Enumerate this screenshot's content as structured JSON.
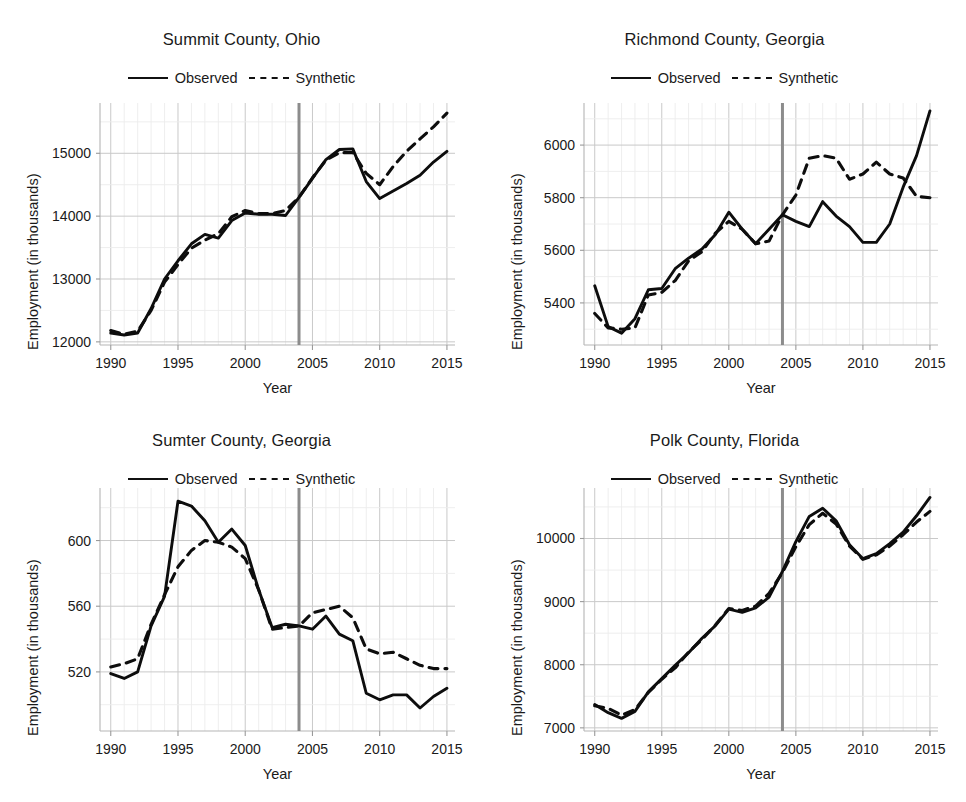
{
  "figure": {
    "panel_count": 4,
    "legend": {
      "observed_label": "Observed",
      "synthetic_label": "Synthetic"
    },
    "axis_labels": {
      "x": "Year",
      "y": "Employment (in thousands)"
    }
  },
  "chart_data": [
    {
      "type": "line",
      "title": "Summit County, Ohio",
      "xlabel": "Year",
      "ylabel": "Employment (in thousands)",
      "xlim": [
        1989.2,
        2015.6
      ],
      "ylim": [
        11950,
        15800
      ],
      "xticks": [
        1990,
        1995,
        2000,
        2005,
        2010,
        2015
      ],
      "yticks": [
        12000,
        13000,
        14000,
        15000
      ],
      "grid": true,
      "legend_position": "top-center",
      "intervention_year": 2004,
      "x": [
        1990,
        1991,
        1992,
        1993,
        1994,
        1995,
        1996,
        1997,
        1998,
        1999,
        2000,
        2001,
        2002,
        2003,
        2004,
        2005,
        2006,
        2007,
        2008,
        2009,
        2010,
        2011,
        2012,
        2013,
        2014,
        2015
      ],
      "series": [
        {
          "name": "Observed",
          "style": "solid",
          "values": [
            12140,
            12110,
            12140,
            12530,
            13000,
            13290,
            13560,
            13710,
            13650,
            13930,
            14050,
            14030,
            14030,
            14010,
            14300,
            14600,
            14900,
            15060,
            15070,
            14550,
            14280,
            14400,
            14520,
            14650,
            14860,
            15030
          ]
        },
        {
          "name": "Synthetic",
          "style": "dashed",
          "values": [
            12180,
            12120,
            12170,
            12500,
            12950,
            13230,
            13490,
            13620,
            13720,
            13990,
            14090,
            14040,
            14040,
            14090,
            14300,
            14610,
            14890,
            15010,
            15010,
            14680,
            14500,
            14790,
            15030,
            15230,
            15420,
            15640
          ]
        }
      ]
    },
    {
      "type": "line",
      "title": "Richmond County, Georgia",
      "xlabel": "Year",
      "ylabel": "Employment (in thousands)",
      "xlim": [
        1989.2,
        2015.6
      ],
      "ylim": [
        5240,
        6160
      ],
      "xticks": [
        1990,
        1995,
        2000,
        2005,
        2010,
        2015
      ],
      "yticks": [
        5400,
        5600,
        5800,
        6000
      ],
      "grid": true,
      "legend_position": "top-center",
      "intervention_year": 2004,
      "x": [
        1990,
        1991,
        1992,
        1993,
        1994,
        1995,
        1996,
        1997,
        1998,
        1999,
        2000,
        2001,
        2002,
        2003,
        2004,
        2005,
        2006,
        2007,
        2008,
        2009,
        2010,
        2011,
        2012,
        2013,
        2014,
        2015
      ],
      "series": [
        {
          "name": "Observed",
          "style": "solid",
          "values": [
            5465,
            5310,
            5285,
            5340,
            5450,
            5455,
            5530,
            5570,
            5605,
            5660,
            5745,
            5680,
            5625,
            5680,
            5735,
            5710,
            5690,
            5785,
            5730,
            5690,
            5630,
            5630,
            5700,
            5840,
            5960,
            6130
          ]
        },
        {
          "name": "Synthetic",
          "style": "dashed",
          "values": [
            5360,
            5305,
            5300,
            5305,
            5430,
            5440,
            5485,
            5560,
            5595,
            5665,
            5710,
            5680,
            5625,
            5635,
            5735,
            5810,
            5950,
            5960,
            5950,
            5870,
            5890,
            5935,
            5890,
            5875,
            5805,
            5800
          ]
        }
      ]
    },
    {
      "type": "line",
      "title": "Sumter County, Georgia",
      "xlabel": "Year",
      "ylabel": "Employment (in thousands)",
      "xlim": [
        1989.2,
        2015.6
      ],
      "ylim": [
        484,
        632
      ],
      "xticks": [
        1990,
        1995,
        2000,
        2005,
        2010,
        2015
      ],
      "yticks": [
        520,
        560,
        600
      ],
      "grid": true,
      "legend_position": "top-center",
      "intervention_year": 2004,
      "x": [
        1990,
        1991,
        1992,
        1993,
        1994,
        1995,
        1996,
        1997,
        1998,
        1999,
        2000,
        2001,
        2002,
        2003,
        2004,
        2005,
        2006,
        2007,
        2008,
        2009,
        2010,
        2011,
        2012,
        2013,
        2014,
        2015
      ],
      "series": [
        {
          "name": "Observed",
          "style": "solid",
          "values": [
            519,
            516,
            520,
            548,
            566,
            624,
            621,
            612,
            599,
            607,
            597,
            570,
            547,
            549,
            548,
            546,
            554,
            543,
            539,
            507,
            503,
            506,
            506,
            498,
            505,
            510
          ]
        },
        {
          "name": "Synthetic",
          "style": "dashed",
          "values": [
            523,
            525,
            528,
            549,
            567,
            584,
            594,
            600,
            599,
            596,
            589,
            570,
            546,
            547,
            548,
            556,
            558,
            560,
            553,
            534,
            531,
            532,
            528,
            524,
            522,
            522
          ]
        }
      ]
    },
    {
      "type": "line",
      "title": "Polk County, Florida",
      "xlabel": "Year",
      "ylabel": "Employment (in thousands)",
      "xlim": [
        1989.2,
        2015.6
      ],
      "ylim": [
        6950,
        10800
      ],
      "xticks": [
        1990,
        1995,
        2000,
        2005,
        2010,
        2015
      ],
      "yticks": [
        7000,
        8000,
        9000,
        10000
      ],
      "grid": true,
      "legend_position": "top-center",
      "intervention_year": 2004,
      "x": [
        1990,
        1991,
        1992,
        1993,
        1994,
        1995,
        1996,
        1997,
        1998,
        1999,
        2000,
        2001,
        2002,
        2003,
        2004,
        2005,
        2006,
        2007,
        2008,
        2009,
        2010,
        2011,
        2012,
        2013,
        2014,
        2015
      ],
      "series": [
        {
          "name": "Observed",
          "style": "solid",
          "values": [
            7370,
            7240,
            7150,
            7260,
            7570,
            7780,
            7990,
            8190,
            8420,
            8620,
            8880,
            8830,
            8900,
            9070,
            9480,
            9950,
            10350,
            10480,
            10280,
            9900,
            9680,
            9760,
            9920,
            10100,
            10360,
            10650
          ]
        },
        {
          "name": "Synthetic",
          "style": "dashed",
          "values": [
            7350,
            7310,
            7200,
            7290,
            7560,
            7770,
            7950,
            8200,
            8400,
            8630,
            8890,
            8860,
            8930,
            9130,
            9460,
            9870,
            10220,
            10400,
            10230,
            9880,
            9670,
            9740,
            9880,
            10060,
            10260,
            10430
          ]
        }
      ]
    }
  ]
}
